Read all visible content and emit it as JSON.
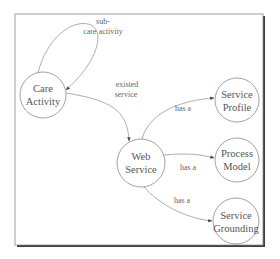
{
  "diagram": {
    "type": "concept-graph",
    "nodes": [
      {
        "id": "care-activity",
        "lines": [
          "Care",
          "Activity"
        ],
        "cx": 43,
        "cy": 95,
        "r": 23
      },
      {
        "id": "web-service",
        "lines": [
          "Web",
          "Service"
        ],
        "cx": 141,
        "cy": 163,
        "r": 24
      },
      {
        "id": "service-profile",
        "lines": [
          "Service",
          "Profile"
        ],
        "cx": 237,
        "cy": 100,
        "r": 22
      },
      {
        "id": "process-model",
        "lines": [
          "Process",
          "Model"
        ],
        "cx": 237,
        "cy": 160,
        "r": 22
      },
      {
        "id": "service-grounding",
        "lines": [
          "Service",
          "Grounding"
        ],
        "cx": 236,
        "cy": 221,
        "r": 23
      }
    ],
    "edges": [
      {
        "from": "care-activity",
        "to": "care-activity",
        "label": [
          "sub-",
          "care activity"
        ]
      },
      {
        "from": "care-activity",
        "to": "web-service",
        "label": [
          "existed",
          "service"
        ]
      },
      {
        "from": "web-service",
        "to": "service-profile",
        "label": [
          "has a"
        ]
      },
      {
        "from": "web-service",
        "to": "process-model",
        "label": [
          "has a"
        ]
      },
      {
        "from": "web-service",
        "to": "service-grounding",
        "label": [
          "has a"
        ]
      }
    ]
  },
  "labels": {
    "care_activity_1": "Care",
    "care_activity_2": "Activity",
    "web_service_1": "Web",
    "web_service_2": "Service",
    "service_profile_1": "Service",
    "service_profile_2": "Profile",
    "process_model_1": "Process",
    "process_model_2": "Model",
    "service_grounding_1": "Service",
    "service_grounding_2": "Grounding",
    "self_loop_1": "sub-",
    "self_loop_2": "care activity",
    "existed_1": "existed",
    "existed_2": "service",
    "has_a_profile": "has a",
    "has_a_model": "has a",
    "has_a_grounding": "has a"
  },
  "colors": {
    "frame_border": "#8a8a8a",
    "frame_shadow": "#3c3c3c",
    "node_stroke": "#7a7a7a",
    "edge_stroke": "#8c8c8c",
    "text": "#555555"
  }
}
